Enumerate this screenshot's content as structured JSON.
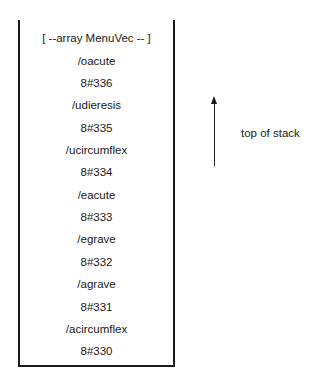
{
  "stack": {
    "items": [
      "[ --array MenuVec -- ]",
      "/oacute",
      "8#336",
      "/udieresis",
      "8#335",
      "/ucircumflex",
      "8#334",
      "/eacute",
      "8#333",
      "/egrave",
      "8#332",
      "/agrave",
      "8#331",
      "/acircumflex",
      "8#330"
    ]
  },
  "annotation": {
    "label": "top of stack",
    "arrow_direction": "up"
  }
}
